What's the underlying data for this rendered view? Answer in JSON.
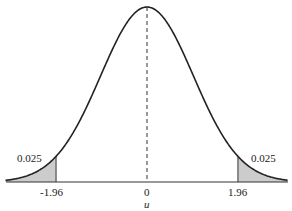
{
  "chart_data": {
    "type": "area",
    "title": "",
    "xlabel": "u",
    "ylabel": "",
    "distribution": "standard normal",
    "x_ticks": [
      "-1.96",
      "0",
      "1.96"
    ],
    "tick_values": [
      -1.96,
      0,
      1.96
    ],
    "shaded_regions": [
      {
        "from": "-inf",
        "to": -1.96,
        "area_label": "0.025"
      },
      {
        "from": 1.96,
        "to": "inf",
        "area_label": "0.025"
      }
    ],
    "center_line": {
      "x": 0,
      "style": "dashed"
    },
    "xlim": [
      -3.05,
      3.04
    ],
    "grid": false,
    "legend": null
  },
  "labels": {
    "left_tail": "0.025",
    "right_tail": "0.025",
    "tick_left": "-1.96",
    "tick_center": "0",
    "tick_right": "1.96",
    "axis": "u"
  },
  "colors": {
    "curve": "#222222",
    "shade": "#cccccc",
    "axis": "#333333"
  }
}
